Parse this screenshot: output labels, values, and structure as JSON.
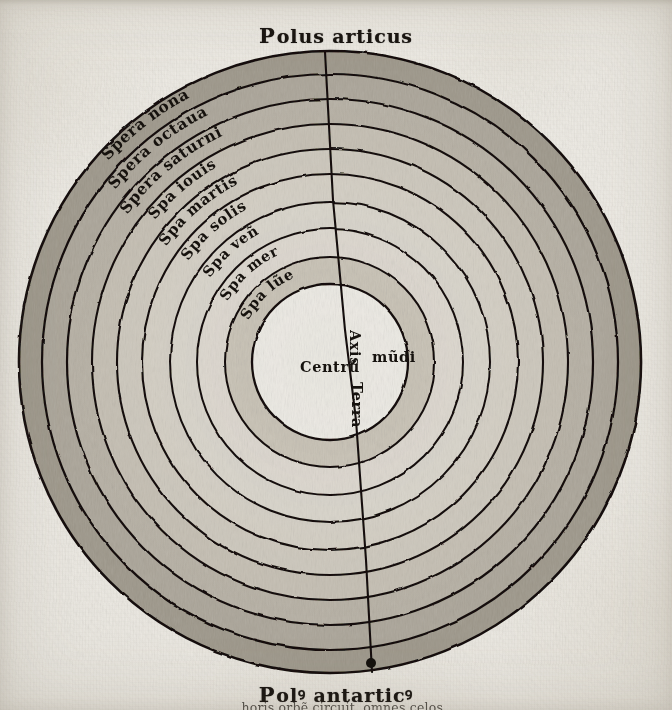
{
  "document": {
    "title_top": "Polus articus",
    "title_top_initial": "P",
    "title_top_rest": "olus articus",
    "title_bottom": "Polꝰ antarticꝰ",
    "title_bottom_initial": "P",
    "title_bottom_rest": "olꝰ antarticꝰ",
    "body_line": "...horis orbẽ circuit, omnes celos"
  },
  "colors": {
    "ink": "#16120e",
    "paper": "#eceae4",
    "outer_ring_shade": "#9d978a",
    "mid_ring_shade": "#b8b2a6",
    "inner_ring_shade": "#ddd9d0",
    "earth_fill": "#f3f1ec"
  },
  "diagram": {
    "center_x": 330,
    "center_y": 362,
    "outer_radius": 311,
    "earth_radius": 56,
    "axis_label": "axis-mundi-line",
    "pole_dot": {
      "x": 371,
      "y": 663,
      "r": 5
    },
    "rings": [
      {
        "index": 0,
        "label": "Spera nona",
        "outer_r": 311,
        "inner_r": 288,
        "shade": "#9d978a",
        "label_angle": -128
      },
      {
        "index": 1,
        "label": "Spera octaua",
        "outer_r": 288,
        "inner_r": 263,
        "shade": "#aaa498",
        "label_angle": -124
      },
      {
        "index": 2,
        "label": "Spera saturni",
        "outer_r": 263,
        "inner_r": 238,
        "shade": "#b5afa3",
        "label_angle": -120
      },
      {
        "index": 3,
        "label": "Spa iouis",
        "outer_r": 238,
        "inner_r": 213,
        "shade": "#c2bcb0",
        "label_angle": -115
      },
      {
        "index": 4,
        "label": "Spa martis",
        "outer_r": 213,
        "inner_r": 188,
        "shade": "#cbc6bb",
        "label_angle": -112
      },
      {
        "index": 5,
        "label": "Spa solis",
        "outer_r": 188,
        "inner_r": 160,
        "shade": "#d2cdc3",
        "label_angle": -108
      },
      {
        "index": 6,
        "label": "Spa veñ",
        "outer_r": 160,
        "inner_r": 133,
        "shade": "#d8d4ca",
        "label_angle": -104
      },
      {
        "index": 7,
        "label": "Spa mer",
        "outer_r": 133,
        "inner_r": 105,
        "shade": "#ded9d0",
        "label_angle": -99
      },
      {
        "index": 8,
        "label": "Spa lũe",
        "outer_r": 105,
        "inner_r": 78,
        "shade": "#c8c2b6",
        "label_angle": -94
      }
    ],
    "earth_labels": [
      {
        "name": "centrum",
        "text": "Centrũ",
        "x": 320,
        "y": 370,
        "rotate": 0
      },
      {
        "name": "axis",
        "text": "Axis",
        "x": 352,
        "y": 332,
        "rotate": 90
      },
      {
        "name": "mundi",
        "text": "mũdi",
        "x": 389,
        "y": 356,
        "rotate": 0
      },
      {
        "name": "terra",
        "text": "Terra",
        "x": 358,
        "y": 392,
        "rotate": 90
      }
    ]
  }
}
